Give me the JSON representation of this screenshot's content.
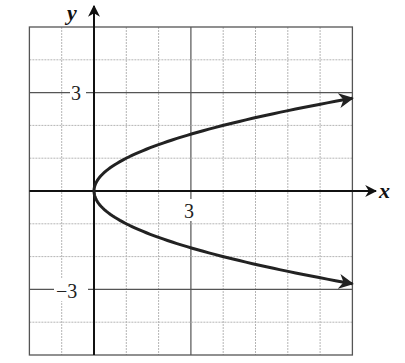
{
  "chart_data": {
    "type": "line",
    "title": "",
    "xlabel": "x",
    "ylabel": "y",
    "xlim": [
      -2,
      8
    ],
    "ylim": [
      -5,
      5
    ],
    "grid": true,
    "x_tick_labels": [
      {
        "value": 3,
        "label": "3"
      }
    ],
    "y_tick_labels": [
      {
        "value": 3,
        "label": "3"
      },
      {
        "value": -3,
        "label": "−3"
      }
    ],
    "series": [
      {
        "name": "x = y^2",
        "equation": "x = y^2",
        "points": [
          {
            "x": 8,
            "y": -2.83
          },
          {
            "x": 4,
            "y": -2
          },
          {
            "x": 1,
            "y": -1
          },
          {
            "x": 0,
            "y": 0
          },
          {
            "x": 1,
            "y": 1
          },
          {
            "x": 4,
            "y": 2
          },
          {
            "x": 8,
            "y": 2.83
          }
        ],
        "arrows_at_ends": true
      }
    ]
  },
  "labels": {
    "x_axis": "x",
    "y_axis": "y",
    "x_tick_3": "3",
    "y_tick_3": "3",
    "y_tick_neg3": "−3"
  }
}
